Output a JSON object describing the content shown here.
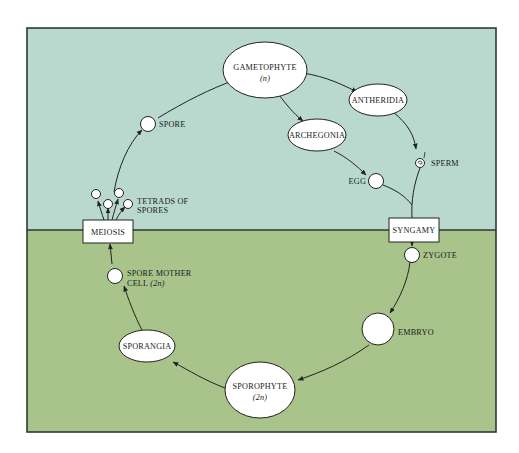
{
  "colors": {
    "haploid_bg": "#b9d9cf",
    "diploid_bg": "#a8c48a",
    "frame": "#2e3a33",
    "node_fill": "#ffffff",
    "stroke": "#222222"
  },
  "phases": {
    "upper": "haploid",
    "lower": "diploid"
  },
  "nodes": {
    "gametophyte": {
      "label": "GAMETOPHYTE",
      "sublabel": "(n)"
    },
    "antheridia": {
      "label": "ANTHERIDIA"
    },
    "archegonia": {
      "label": "ARCHEGONIA"
    },
    "sperm": {
      "label": "SPERM"
    },
    "egg": {
      "label": "EGG"
    },
    "syngamy": {
      "label": "SYNGAMY"
    },
    "zygote": {
      "label": "ZYGOTE"
    },
    "embryo": {
      "label": "EMBRYO"
    },
    "sporophyte": {
      "label": "SPOROPHYTE",
      "sublabel": "(2n)"
    },
    "sporangia": {
      "label": "SPORANGIA"
    },
    "spore_mother_cell": {
      "label_line1": "SPORE MOTHER",
      "label_line2": "CELL",
      "sublabel": "(2n)"
    },
    "meiosis": {
      "label": "MEIOSIS"
    },
    "tetrads": {
      "label_line1": "TETRADS OF",
      "label_line2": "SPORES"
    },
    "spore": {
      "label": "SPORE"
    }
  },
  "edges": [
    [
      "spore",
      "gametophyte"
    ],
    [
      "gametophyte",
      "antheridia"
    ],
    [
      "gametophyte",
      "archegonia"
    ],
    [
      "antheridia",
      "sperm"
    ],
    [
      "archegonia",
      "egg"
    ],
    [
      "sperm",
      "syngamy"
    ],
    [
      "egg",
      "syngamy"
    ],
    [
      "syngamy",
      "zygote"
    ],
    [
      "zygote",
      "embryo"
    ],
    [
      "embryo",
      "sporophyte"
    ],
    [
      "sporophyte",
      "sporangia"
    ],
    [
      "sporangia",
      "spore_mother_cell"
    ],
    [
      "spore_mother_cell",
      "meiosis"
    ],
    [
      "meiosis",
      "tetrads"
    ],
    [
      "tetrads",
      "spore"
    ]
  ]
}
